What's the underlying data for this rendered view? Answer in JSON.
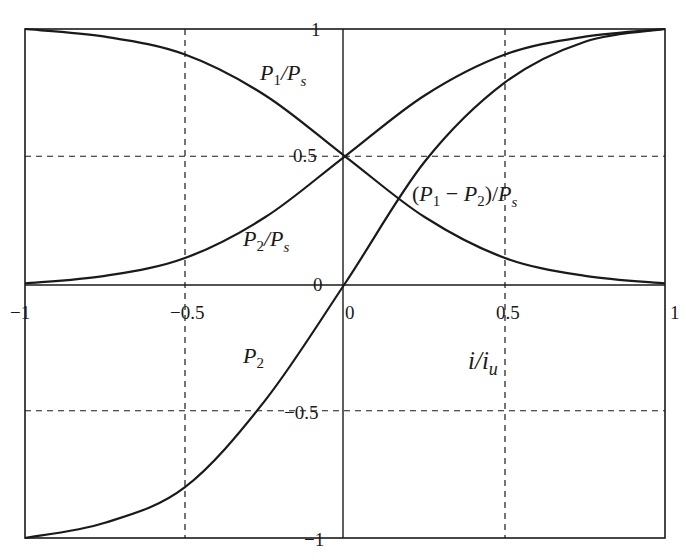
{
  "chart_data": {
    "type": "line",
    "title": "",
    "xlabel": "i/i_u",
    "ylabel": "",
    "xlim": [
      -1,
      1
    ],
    "ylim": [
      -1,
      1
    ],
    "grid": "dashed at ±0.5",
    "x_ticks": [
      "-1",
      "-0.5",
      "0",
      "0.5",
      "1"
    ],
    "y_ticks": [
      "1",
      "0.5",
      "0",
      "-0.5",
      "-1"
    ],
    "x": [
      -1,
      -0.75,
      -0.5,
      -0.25,
      0,
      0.25,
      0.5,
      0.75,
      1
    ],
    "series": [
      {
        "name": "P1/Ps",
        "values": [
          1.0,
          0.97,
          0.9,
          0.74,
          0.5,
          0.26,
          0.1,
          0.03,
          0.0
        ]
      },
      {
        "name": "P2/Ps",
        "values": [
          0.0,
          0.03,
          0.1,
          0.26,
          0.5,
          0.74,
          0.9,
          0.97,
          1.0
        ]
      },
      {
        "name": "(P1-P2)/Ps",
        "values": [
          -1.0,
          -0.94,
          -0.8,
          -0.46,
          0.0,
          0.48,
          0.79,
          0.95,
          1.0
        ]
      }
    ],
    "annotations": [
      "P1/Ps",
      "P2/Ps",
      "(P1 - P2)/Ps",
      "P2",
      "i/iu"
    ]
  },
  "labels": {
    "p1ps": {
      "p": "P",
      "sub1": "1",
      "slash": "/",
      "p2": "P",
      "sub2": "s"
    },
    "p2ps": {
      "p": "P",
      "sub1": "2",
      "slash": "/",
      "p2": "P",
      "sub2": "s"
    },
    "diff": {
      "open": "(",
      "p": "P",
      "sub1": "1",
      "minus": " − ",
      "p2": "P",
      "sub2": "2",
      "close": ")/",
      "p3": "P",
      "sub3": "s"
    },
    "p2": {
      "p": "P",
      "sub": "2"
    },
    "xaxis": {
      "i": "i/i",
      "sub": "u"
    }
  },
  "ticks": {
    "x_neg1": "−1",
    "x_neg05": "−0.5",
    "x_0": "0",
    "x_05": "0.5",
    "x_1": "1",
    "y_1": "1",
    "y_05": "0.5",
    "y_0": "0",
    "y_neg05": "−0.5",
    "y_neg1": "−1"
  },
  "style": {
    "line_color": "#1a1a1a",
    "grid_color": "#1a1a1a",
    "background": "#ffffff"
  }
}
